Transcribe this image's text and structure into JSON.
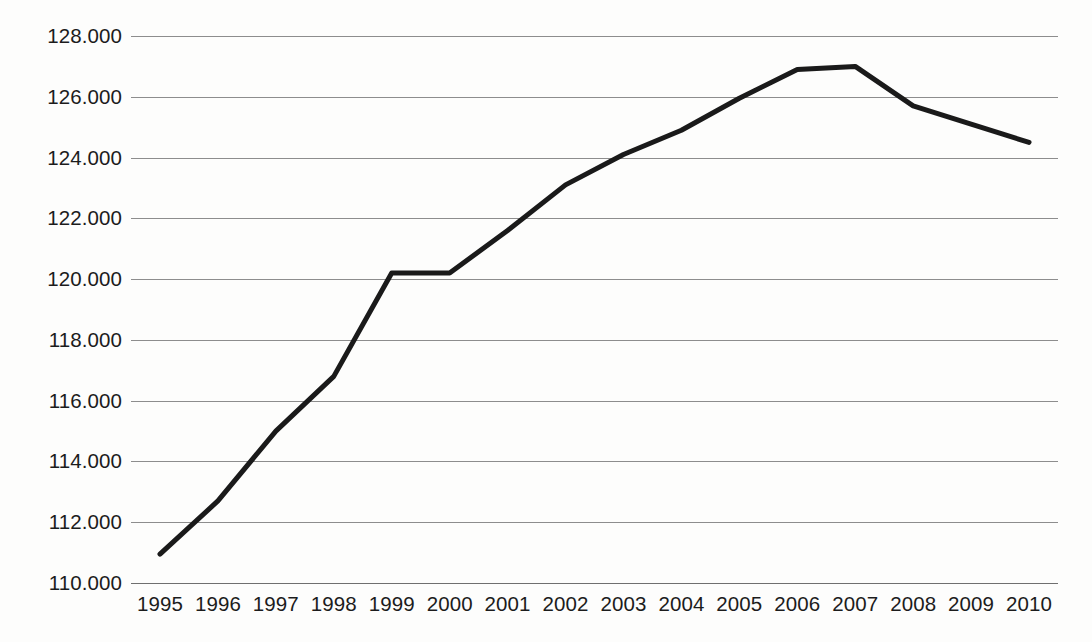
{
  "chart_data": {
    "type": "line",
    "title": "",
    "subtitle": "",
    "xlabel": "",
    "ylabel": "",
    "categories": [
      "1995",
      "1996",
      "1997",
      "1998",
      "1999",
      "2000",
      "2001",
      "2002",
      "2003",
      "2004",
      "2005",
      "2006",
      "2007",
      "2008",
      "2009",
      "2010"
    ],
    "values": [
      110950,
      112700,
      115000,
      116800,
      120200,
      120200,
      121600,
      123100,
      124100,
      124900,
      125950,
      126900,
      127000,
      125700,
      125100,
      124500
    ],
    "series": [
      {
        "name": "",
        "values": [
          110950,
          112700,
          115000,
          116800,
          120200,
          120200,
          121600,
          123100,
          124100,
          124900,
          125950,
          126900,
          127000,
          125700,
          125100,
          124500
        ]
      }
    ],
    "ylim": [
      110000,
      128000
    ],
    "ytick_values": [
      110000,
      112000,
      114000,
      116000,
      118000,
      120000,
      122000,
      124000,
      126000,
      128000
    ],
    "ytick_labels": [
      "110.000",
      "112.000",
      "114.000",
      "116.000",
      "118.000",
      "120.000",
      "122.000",
      "124.000",
      "126.000",
      "128.000"
    ],
    "xtick_labels": [
      "1995",
      "1996",
      "1997",
      "1998",
      "1999",
      "2000",
      "2001",
      "2002",
      "2003",
      "2004",
      "2005",
      "2006",
      "2007",
      "2008",
      "2009",
      "2010"
    ],
    "grid": true,
    "grid_axis": "y",
    "legend": false,
    "legend_position": "none",
    "line_color": "#1a1a1a",
    "line_width": 5,
    "grid_color": "#8d8d8d",
    "background_color": "#fdfdfc",
    "text_color": "#1c1c1c",
    "annotations": []
  }
}
